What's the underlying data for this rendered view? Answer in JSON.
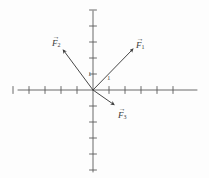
{
  "figure": {
    "background_color": "#fdfdfd",
    "ink_color": "#555555",
    "label_color": "#3a3a3a"
  },
  "axes": {
    "origin": {
      "x": 93,
      "y": 90
    },
    "tick_spacing": 16,
    "tick_length": 7,
    "x_axis": {
      "x_start": 18,
      "x_end": 197,
      "y": 90,
      "ticks_left": 5,
      "ticks_right": 5
    },
    "y_axis": {
      "x": 93,
      "y_start": 11,
      "y_end": 172,
      "ticks_up": 5,
      "ticks_down": 5
    },
    "unit_labels": [
      {
        "text": "1",
        "axis": "y",
        "x": 88,
        "y": 71
      },
      {
        "text": "1",
        "axis": "x",
        "x": 107,
        "y": 75
      }
    ]
  },
  "vectors": [
    {
      "name": "F1",
      "label_text": "F",
      "label_sub": "1",
      "tail": {
        "x": 93,
        "y": 90
      },
      "tip": {
        "x": 132,
        "y": 50
      },
      "label_pos": {
        "x": 136,
        "y": 38
      },
      "direction": "up-right"
    },
    {
      "name": "F2",
      "label_text": "F",
      "label_sub": "2",
      "tail": {
        "x": 93,
        "y": 90
      },
      "tip": {
        "x": 64,
        "y": 51
      },
      "label_pos": {
        "x": 52,
        "y": 36
      },
      "direction": "up-left"
    },
    {
      "name": "F3",
      "label_text": "F",
      "label_sub": "3",
      "tail": {
        "x": 93,
        "y": 90
      },
      "tip": {
        "x": 113,
        "y": 104
      },
      "label_pos": {
        "x": 118,
        "y": 108
      },
      "direction": "down-right"
    }
  ],
  "chart_data": {
    "type": "scatter",
    "title": "",
    "xlabel": "",
    "ylabel": "",
    "xlim": [
      -5,
      5
    ],
    "ylim": [
      -5,
      5
    ],
    "grid": false,
    "axis_style": "crossed-axes-with-ticks",
    "tick_unit": 1,
    "series": [
      {
        "name": "F1",
        "components": [
          2.4,
          2.5
        ],
        "label": "F⃗1"
      },
      {
        "name": "F2",
        "components": [
          -1.8,
          2.4
        ],
        "label": "F⃗2"
      },
      {
        "name": "F3",
        "components": [
          1.25,
          -0.85
        ],
        "label": "F⃗3"
      }
    ]
  }
}
